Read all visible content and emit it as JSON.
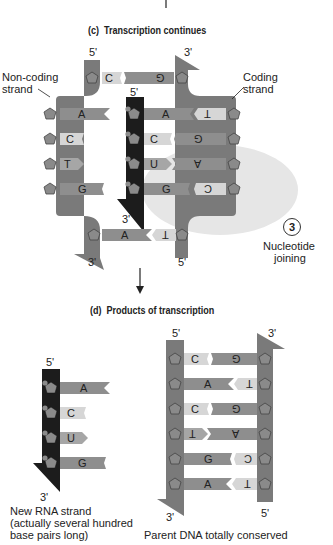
{
  "panel_c": {
    "label": "(c)",
    "title": "Transcription continues",
    "noncoding_label": "Non-coding\nstrand",
    "noncoding_line1": "Non-coding",
    "noncoding_line2": "strand",
    "coding_line1": "Coding",
    "coding_line2": "strand",
    "primes": {
      "noncoding_top": "5'",
      "noncoding_bottom": "3'",
      "coding_top": "3'",
      "coding_bottom": "5'",
      "rna_top": "5'",
      "rna_bottom": "3'"
    },
    "top_pair": [
      "C",
      "G"
    ],
    "noncoding_bases": [
      "A",
      "C",
      "T",
      "G"
    ],
    "rna_bases": [
      "A",
      "C",
      "U",
      "G"
    ],
    "coding_bases": [
      "T",
      "G",
      "A",
      "C"
    ],
    "bottom_pair": [
      "A",
      "T"
    ],
    "step": {
      "number": "3",
      "line1": "Nucleotide",
      "line2": "joining"
    }
  },
  "panel_d": {
    "label": "(d)",
    "title": "Products of transcription",
    "rna": {
      "prime_top": "5'",
      "prime_bottom": "3'",
      "bases": [
        "A",
        "C",
        "U",
        "G"
      ],
      "caption_line1": "New RNA strand",
      "caption_line2": "(actually several hundred",
      "caption_line3": "base pairs long)"
    },
    "dna": {
      "left_top": "5'",
      "left_bottom": "3'",
      "right_top": "3'",
      "right_bottom": "5'",
      "left_bases": [
        "C",
        "A",
        "C",
        "T",
        "G",
        "A"
      ],
      "right_bases": [
        "G",
        "T",
        "G",
        "A",
        "C",
        "T"
      ],
      "caption": "Parent DNA totally conserved"
    }
  },
  "colors": {
    "dna_strand": "#7a7a7a",
    "rna_strand": "#1a1a1a",
    "base_dark": "#8e8e8e",
    "base_light": "#d6d6d6",
    "highlight": "#e4e4e4"
  }
}
